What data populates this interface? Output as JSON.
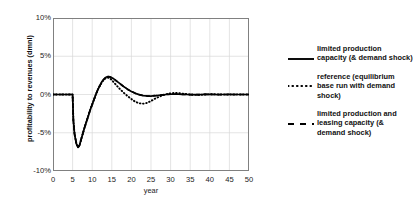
{
  "chart_data": {
    "type": "line",
    "title": "",
    "xlabel": "year",
    "ylabel": "profitability to revenues (dmnl)",
    "xlim": [
      0,
      50
    ],
    "ylim": [
      -10,
      10
    ],
    "grid": true,
    "legend_position": "right",
    "xticks": [
      "0",
      "5",
      "10",
      "15",
      "20",
      "25",
      "30",
      "35",
      "40",
      "45",
      "50"
    ],
    "yticks": [
      "10%",
      "5%",
      "0%",
      "-5%",
      "-10%"
    ],
    "x": [
      0,
      1,
      2,
      3,
      4,
      5,
      5.2,
      5.5,
      6,
      6.4,
      6.8,
      7,
      7.5,
      8,
      8.5,
      9,
      9.5,
      10,
      10.5,
      11,
      11.5,
      12,
      12.5,
      13,
      13.5,
      14,
      14.5,
      15,
      15.5,
      16,
      17,
      18,
      19,
      20,
      21,
      22,
      23,
      24,
      25,
      26,
      27,
      28,
      29,
      30,
      31,
      32,
      33,
      34,
      35,
      36,
      37,
      38,
      39,
      40,
      41,
      42,
      43,
      44,
      45,
      46,
      47,
      48,
      49,
      50
    ],
    "series": [
      {
        "name": "limited production capacity (& demand shock)",
        "style": "solid",
        "values": [
          0,
          0,
          0,
          0,
          0,
          0,
          -3.4,
          -5.2,
          -6.5,
          -6.9,
          -6.6,
          -6.2,
          -5.3,
          -4.4,
          -3.6,
          -2.8,
          -2.0,
          -1.3,
          -0.6,
          0.1,
          0.7,
          1.2,
          1.7,
          2.0,
          2.25,
          2.35,
          2.3,
          2.2,
          2.05,
          1.85,
          1.45,
          1.05,
          0.7,
          0.4,
          0.15,
          -0.02,
          -0.14,
          -0.2,
          -0.2,
          -0.16,
          -0.1,
          -0.04,
          0.0,
          0.03,
          0.04,
          0.03,
          0.02,
          0.0,
          -0.01,
          -0.02,
          -0.01,
          0.0,
          0.01,
          0.01,
          0.0,
          -0.01,
          0.0,
          0.0,
          0.01,
          0.0,
          0.0,
          0.0,
          0.0,
          0.0
        ]
      },
      {
        "name": "reference (equilibrium base run with demand shock)",
        "style": "dotted",
        "values": [
          0,
          0,
          0,
          0,
          0,
          0,
          -3.4,
          -5.2,
          -6.5,
          -6.9,
          -6.6,
          -6.2,
          -5.3,
          -4.4,
          -3.6,
          -2.8,
          -2.0,
          -1.3,
          -0.6,
          0.1,
          0.7,
          1.2,
          1.65,
          1.95,
          2.15,
          2.2,
          2.1,
          1.9,
          1.6,
          1.3,
          0.75,
          0.25,
          -0.2,
          -0.6,
          -0.95,
          -1.15,
          -1.2,
          -1.1,
          -0.85,
          -0.55,
          -0.3,
          -0.1,
          0.05,
          0.15,
          0.2,
          0.18,
          0.12,
          0.06,
          0.0,
          -0.04,
          -0.05,
          -0.03,
          0.0,
          0.02,
          0.03,
          0.02,
          0.0,
          -0.01,
          -0.01,
          0.0,
          0.01,
          0.0,
          0.0,
          0.0
        ]
      },
      {
        "name": "limited production and leasing capacity (& demand shock)",
        "style": "dashed",
        "values": [
          0,
          0,
          0,
          0,
          0,
          0,
          -3.4,
          -5.2,
          -6.5,
          -6.9,
          -6.6,
          -6.2,
          -5.3,
          -4.4,
          -3.6,
          -2.8,
          -2.0,
          -1.3,
          -0.6,
          0.1,
          0.7,
          1.2,
          1.7,
          2.0,
          2.25,
          2.35,
          2.3,
          2.2,
          2.05,
          1.85,
          1.45,
          1.05,
          0.7,
          0.4,
          0.15,
          -0.02,
          -0.14,
          -0.2,
          -0.2,
          -0.16,
          -0.1,
          -0.04,
          0.0,
          0.03,
          0.04,
          0.03,
          0.02,
          0.0,
          -0.01,
          -0.02,
          -0.01,
          0.0,
          0.01,
          0.01,
          0.0,
          -0.01,
          0.0,
          0.0,
          0.01,
          0.0,
          0.0,
          0.0,
          0.0,
          0.0
        ]
      }
    ],
    "legend": [
      {
        "label": "limited production capacity (& demand shock)",
        "style": "solid"
      },
      {
        "label": "reference (equilibrium base run with demand shock)",
        "style": "dotted"
      },
      {
        "label": "limited production and leasing capacity (& demand shock)",
        "style": "dashed"
      }
    ],
    "colors": {
      "line": "#000000",
      "grid": "#d9d9d9",
      "frame": "#808080",
      "text": "#111111"
    }
  }
}
